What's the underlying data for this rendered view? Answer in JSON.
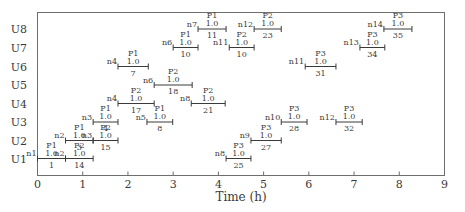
{
  "chart_data": {
    "type": "gantt",
    "title": "",
    "xlabel": "Time (h)",
    "ylabel": "",
    "xlim": [
      0,
      9
    ],
    "x_ticks": [
      "0",
      "1",
      "2",
      "3",
      "4",
      "5",
      "6",
      "7",
      "8",
      "9"
    ],
    "rows": [
      "U8",
      "U7",
      "U6",
      "U5",
      "U4",
      "U3",
      "U2",
      "U1"
    ],
    "grid": false,
    "legend": null,
    "tasks": [
      {
        "row": "U1",
        "node": "n1",
        "product": "P1",
        "size": "1.0",
        "id": "1",
        "start": 0.0,
        "end": 0.62
      },
      {
        "row": "U1",
        "node": "n2",
        "product": "P2",
        "size": "1.0",
        "id": "14",
        "start": 0.62,
        "end": 1.23
      },
      {
        "row": "U1",
        "node": "n8",
        "product": "P3",
        "size": "1.0",
        "id": "25",
        "start": 4.17,
        "end": 4.72
      },
      {
        "row": "U2",
        "node": "n2",
        "product": "P1",
        "size": "1.0",
        "id": "3",
        "start": 0.62,
        "end": 1.23
      },
      {
        "row": "U2",
        "node": "n3",
        "product": "P2",
        "size": "1.0",
        "id": "15",
        "start": 1.23,
        "end": 1.78
      },
      {
        "row": "U2",
        "node": "n9",
        "product": "P3",
        "size": "1.0",
        "id": "27",
        "start": 4.72,
        "end": 5.39
      },
      {
        "row": "U3",
        "node": "n3",
        "product": "P1",
        "size": "1.0",
        "id": "4",
        "start": 1.23,
        "end": 1.78
      },
      {
        "row": "U3",
        "node": "n5",
        "product": "P1",
        "size": "1.0",
        "id": "8",
        "start": 2.42,
        "end": 2.99
      },
      {
        "row": "U3",
        "node": "n10",
        "product": "P3",
        "size": "1.0",
        "id": "28",
        "start": 5.39,
        "end": 5.96
      },
      {
        "row": "U3",
        "node": "n12",
        "product": "P3",
        "size": "1.0",
        "id": "32",
        "start": 6.6,
        "end": 7.18
      },
      {
        "row": "U4",
        "node": "n4",
        "product": "P2",
        "size": "1.0",
        "id": "17",
        "start": 1.78,
        "end": 2.58
      },
      {
        "row": "U4",
        "node": "n8",
        "product": "P2",
        "size": "1.0",
        "id": "21",
        "start": 3.4,
        "end": 4.15
      },
      {
        "row": "U5",
        "node": "n6",
        "product": "P2",
        "size": "1.0",
        "id": "18",
        "start": 2.58,
        "end": 3.42
      },
      {
        "row": "U6",
        "node": "n4",
        "product": "P1",
        "size": "1.0",
        "id": "7",
        "start": 1.78,
        "end": 2.45
      },
      {
        "row": "U6",
        "node": "n11",
        "product": "P3",
        "size": "1.0",
        "id": "31",
        "start": 5.92,
        "end": 6.6
      },
      {
        "row": "U7",
        "node": "n6",
        "product": "P1",
        "size": "1.0",
        "id": "10",
        "start": 3.0,
        "end": 3.55
      },
      {
        "row": "U7",
        "node": "n11",
        "product": "P2",
        "size": "1.0",
        "id": "10",
        "start": 4.24,
        "end": 4.79
      },
      {
        "row": "U7",
        "node": "n13",
        "product": "P3",
        "size": "1.0",
        "id": "34",
        "start": 7.13,
        "end": 7.68
      },
      {
        "row": "U8",
        "node": "n7",
        "product": "P1",
        "size": "1.0",
        "id": "11",
        "start": 3.55,
        "end": 4.17
      },
      {
        "row": "U8",
        "node": "n12",
        "product": "P2",
        "size": "1.0",
        "id": "23",
        "start": 4.79,
        "end": 5.39
      },
      {
        "row": "U8",
        "node": "n14",
        "product": "P3",
        "size": "1.0",
        "id": "35",
        "start": 7.66,
        "end": 8.28
      }
    ]
  },
  "colors": {
    "axis": "#6e6e6e",
    "text": "#3a3a3a",
    "bar": "#3a3a3a",
    "background": "#ffffff"
  }
}
